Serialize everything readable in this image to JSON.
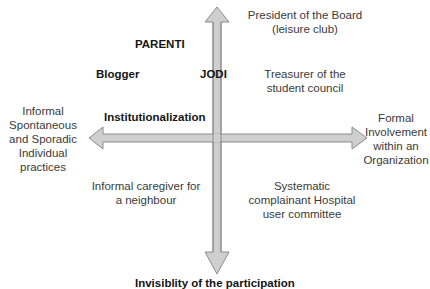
{
  "diagram": {
    "axis_labels": {
      "left": [
        "Informal",
        "Spontaneous",
        "and Sporadic",
        "Individual",
        "practices"
      ],
      "right": [
        "Formal",
        "Involvement",
        "within an",
        "Organization"
      ],
      "bottom": "Invisiblity of the participation",
      "vertical_top_label": "Institutionalization"
    },
    "bold_labels": {
      "parenti": "PARENTI",
      "blogger": "Blogger",
      "jodi": "JODI"
    },
    "quadrant_labels": {
      "top_right_1": [
        "President of the Board",
        "(leisure club)"
      ],
      "top_right_2": [
        "Treasurer of the",
        "student council"
      ],
      "bottom_left": [
        "Informal caregiver for",
        "a neighbour"
      ],
      "bottom_right": [
        "Systematic",
        "complainant Hospital",
        "user committee"
      ]
    },
    "colors": {
      "arrow_fill": "#cfcfcf",
      "arrow_stroke": "#8c8c8c",
      "text": "#3a3a3a",
      "bold_text": "#151515"
    }
  }
}
